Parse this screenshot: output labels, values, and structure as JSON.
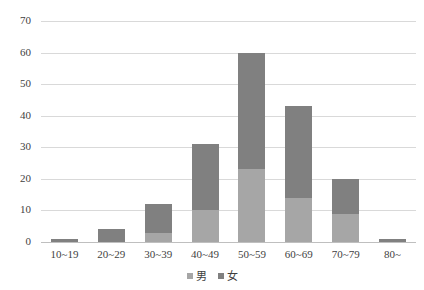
{
  "chart_data": {
    "type": "bar",
    "subtype": "stacked-vertical",
    "title": "",
    "subtitle": "",
    "xlabel": "",
    "ylabel": "",
    "ylim": [
      0,
      70
    ],
    "ytick_step": 10,
    "grid": true,
    "legend_position": "bottom",
    "categories": [
      "10~19",
      "20~29",
      "30~39",
      "40~49",
      "50~59",
      "60~69",
      "70~79",
      "80~"
    ],
    "ytick_labels": [
      "0",
      "10",
      "20",
      "30",
      "40",
      "50",
      "60",
      "70"
    ],
    "series": [
      {
        "name": "男",
        "color": "#a6a6a6",
        "values": [
          0,
          0,
          3,
          10,
          23,
          14,
          9,
          0
        ]
      },
      {
        "name": "女",
        "color": "#808080",
        "values": [
          1,
          4,
          9,
          21,
          37,
          29,
          11,
          1
        ]
      }
    ],
    "totals": [
      1,
      4,
      12,
      31,
      60,
      43,
      20,
      1
    ],
    "annotations": []
  },
  "legend": {
    "items": [
      {
        "label": "男",
        "swatch_color": "#a6a6a6"
      },
      {
        "label": "女",
        "swatch_color": "#808080"
      }
    ]
  },
  "colors": {
    "gridline": "#d9d9d9",
    "baseline": "#bfbfbf",
    "text": "#3f3f3f",
    "background": "#ffffff",
    "series_male": "#a6a6a6",
    "series_female": "#808080"
  }
}
